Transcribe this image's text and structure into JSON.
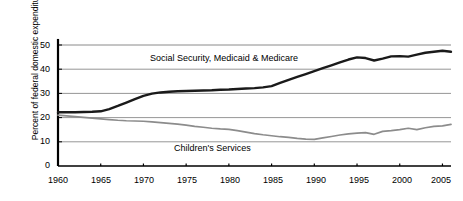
{
  "chart_data": {
    "type": "line",
    "title": "",
    "xlabel": "",
    "ylabel": "Percent of federal domestic expenditures",
    "xlim": [
      1960,
      2006
    ],
    "ylim": [
      0,
      55
    ],
    "grid": true,
    "legend_position": "inline-annotations",
    "x_ticks": [
      "1960",
      "1965",
      "1970",
      "1975",
      "1980",
      "1985",
      "1990",
      "1995",
      "2000",
      "2005"
    ],
    "y_ticks": [
      "0",
      "10",
      "20",
      "30",
      "40",
      "50"
    ],
    "series": [
      {
        "name": "Social Security, Medicaid & Medicare",
        "color": "#1a1a1a",
        "x": [
          1960,
          1961,
          1962,
          1963,
          1964,
          1965,
          1966,
          1967,
          1968,
          1969,
          1970,
          1971,
          1972,
          1973,
          1974,
          1975,
          1976,
          1977,
          1978,
          1979,
          1980,
          1981,
          1982,
          1983,
          1984,
          1985,
          1986,
          1987,
          1988,
          1989,
          1990,
          1991,
          1992,
          1993,
          1994,
          1995,
          1996,
          1997,
          1998,
          1999,
          2000,
          2001,
          2002,
          2003,
          2004,
          2005,
          2006
        ],
        "values": [
          22.2,
          22.2,
          22.2,
          22.3,
          22.4,
          22.6,
          23.5,
          24.8,
          26.2,
          27.6,
          29.0,
          29.9,
          30.4,
          30.7,
          30.9,
          31.0,
          31.1,
          31.2,
          31.3,
          31.5,
          31.6,
          31.8,
          32.0,
          32.2,
          32.5,
          33.0,
          34.3,
          35.6,
          36.8,
          38.0,
          39.2,
          40.4,
          41.6,
          42.8,
          44.0,
          44.9,
          44.6,
          43.6,
          44.4,
          45.3,
          45.4,
          45.2,
          46.0,
          46.8,
          47.2,
          47.6,
          47.2
        ]
      },
      {
        "name": "Children's Services",
        "color": "#8c8c8c",
        "x": [
          1960,
          1961,
          1962,
          1963,
          1964,
          1965,
          1966,
          1967,
          1968,
          1969,
          1970,
          1971,
          1972,
          1973,
          1974,
          1975,
          1976,
          1977,
          1978,
          1979,
          1980,
          1981,
          1982,
          1983,
          1984,
          1985,
          1986,
          1987,
          1988,
          1989,
          1990,
          1991,
          1992,
          1993,
          1994,
          1995,
          1996,
          1997,
          1998,
          1999,
          2000,
          2001,
          2002,
          2003,
          2004,
          2005,
          2006
        ],
        "values": [
          21.0,
          20.7,
          20.4,
          20.1,
          19.8,
          19.5,
          19.2,
          18.9,
          18.7,
          18.6,
          18.5,
          18.2,
          17.9,
          17.6,
          17.3,
          16.9,
          16.4,
          16.0,
          15.6,
          15.3,
          15.1,
          14.6,
          14.0,
          13.4,
          12.9,
          12.5,
          12.1,
          11.8,
          11.4,
          11.1,
          11.0,
          11.6,
          12.2,
          12.8,
          13.3,
          13.6,
          13.8,
          13.1,
          14.3,
          14.6,
          15.0,
          15.6,
          15.0,
          15.8,
          16.4,
          16.6,
          17.2
        ]
      }
    ],
    "annotations": [
      {
        "text": "Social Security, Medicaid & Medicare",
        "x": 1978,
        "y": 39.5
      },
      {
        "text": "Children's Services",
        "x": 1979,
        "y": 7.0
      }
    ]
  }
}
